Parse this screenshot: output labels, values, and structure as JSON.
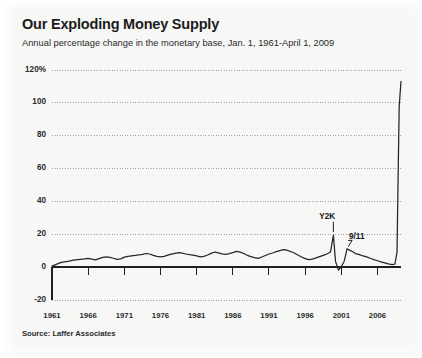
{
  "header": {
    "title": "Our Exploding Money Supply",
    "subtitle": "Annual percentage change in the monetary base, Jan. 1, 1961-April 1, 2009",
    "source": "Source: Laffer Associates"
  },
  "chart_data": {
    "type": "line",
    "title": "Our Exploding Money Supply",
    "subtitle": "Annual percentage change in the monetary base, Jan. 1, 1961-April 1, 2009",
    "source": "Source: Laffer Associates",
    "xlabel": "",
    "ylabel": "",
    "xlim": [
      1961,
      2009.25
    ],
    "ylim": [
      -20,
      120
    ],
    "grid": true,
    "grid_style": "dotted",
    "legend": false,
    "yticks": [
      -20,
      0,
      20,
      40,
      60,
      80,
      100,
      120
    ],
    "ytick_labels": [
      "-20",
      "0",
      "20",
      "40",
      "60",
      "80",
      "100",
      "120%"
    ],
    "xticks": [
      1961,
      1966,
      1971,
      1976,
      1981,
      1986,
      1991,
      1996,
      2001,
      2006
    ],
    "xtick_labels": [
      "1961",
      "1966",
      "1971",
      "1976",
      "1981",
      "1986",
      "1991",
      "1996",
      "2001",
      "2006"
    ],
    "colors": {
      "line": "#262626",
      "grid": "#9a9a9a",
      "axis": "#1f1f1f",
      "background": "#f7f7f6",
      "text": "#2b2b2b"
    },
    "annotations": [
      {
        "label": "Y2K",
        "x": 1999.9,
        "y": 19.5,
        "text_x": 1999.2,
        "text_y": 30.0
      },
      {
        "label": "9/11",
        "x": 2001.8,
        "y": 11.2,
        "text_x": 2003.3,
        "text_y": 17.5
      }
    ],
    "series": [
      {
        "name": "Monetary base annual % change",
        "x": [
          1961.0,
          1961.5,
          1962.0,
          1962.5,
          1963.0,
          1963.5,
          1964.0,
          1964.5,
          1965.0,
          1965.5,
          1966.0,
          1966.5,
          1967.0,
          1967.5,
          1968.0,
          1968.5,
          1969.0,
          1969.5,
          1970.0,
          1970.5,
          1971.0,
          1971.5,
          1972.0,
          1972.5,
          1973.0,
          1973.5,
          1974.0,
          1974.5,
          1975.0,
          1975.5,
          1976.0,
          1976.5,
          1977.0,
          1977.5,
          1978.0,
          1978.5,
          1979.0,
          1979.5,
          1980.0,
          1980.5,
          1981.0,
          1981.5,
          1982.0,
          1982.5,
          1983.0,
          1983.5,
          1984.0,
          1984.5,
          1985.0,
          1985.5,
          1986.0,
          1986.5,
          1987.0,
          1987.5,
          1988.0,
          1988.5,
          1989.0,
          1989.5,
          1990.0,
          1990.5,
          1991.0,
          1991.5,
          1992.0,
          1992.5,
          1993.0,
          1993.5,
          1994.0,
          1994.5,
          1995.0,
          1995.5,
          1996.0,
          1996.5,
          1997.0,
          1997.5,
          1998.0,
          1998.5,
          1999.0,
          1999.5,
          1999.9,
          2000.2,
          2000.6,
          2001.0,
          2001.4,
          2001.8,
          2002.2,
          2002.6,
          2003.0,
          2003.5,
          2004.0,
          2004.5,
          2005.0,
          2005.5,
          2006.0,
          2006.5,
          2007.0,
          2007.5,
          2008.0,
          2008.4,
          2008.7,
          2008.85,
          2009.0,
          2009.25
        ],
        "y": [
          0.6,
          1.5,
          2.4,
          3.0,
          3.4,
          3.8,
          4.3,
          4.6,
          4.8,
          5.0,
          5.4,
          4.9,
          4.4,
          5.2,
          6.0,
          6.3,
          6.0,
          5.4,
          4.7,
          5.0,
          6.1,
          6.6,
          6.9,
          7.1,
          7.4,
          7.8,
          8.3,
          8.0,
          7.2,
          6.5,
          6.2,
          6.6,
          7.3,
          7.9,
          8.4,
          8.8,
          8.5,
          8.0,
          7.6,
          7.3,
          6.8,
          6.2,
          6.6,
          7.4,
          8.4,
          9.2,
          8.7,
          8.1,
          7.8,
          8.2,
          8.8,
          9.6,
          9.1,
          8.3,
          7.2,
          6.4,
          5.8,
          5.3,
          6.2,
          7.1,
          8.0,
          8.6,
          9.4,
          10.1,
          10.7,
          10.3,
          9.5,
          8.6,
          7.4,
          6.2,
          5.2,
          4.6,
          4.9,
          5.6,
          6.4,
          7.2,
          8.0,
          9.2,
          19.5,
          3.5,
          -1.8,
          0.4,
          3.6,
          11.2,
          10.2,
          9.4,
          8.2,
          7.6,
          6.8,
          6.2,
          5.4,
          4.6,
          3.9,
          3.2,
          2.6,
          2.0,
          1.6,
          1.8,
          9.0,
          55.0,
          98.0,
          113.0
        ]
      }
    ]
  },
  "axis": {
    "y_labels": [
      "120%",
      "100",
      "80",
      "60",
      "40",
      "20",
      "0",
      "-20"
    ],
    "x_labels": [
      "1961",
      "1966",
      "1971",
      "1976",
      "1981",
      "1986",
      "1991",
      "1996",
      "2001",
      "2006"
    ]
  },
  "annotations": {
    "y2k": "Y2K",
    "nine_eleven": "9/11"
  }
}
